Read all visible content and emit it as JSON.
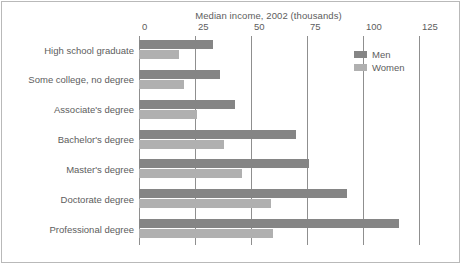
{
  "chart_data": {
    "type": "bar",
    "orientation": "horizontal",
    "title": "Median income, 2002 (thousands)",
    "xlabel": "",
    "ylabel": "",
    "xlim": [
      0,
      125
    ],
    "xticks": [
      0,
      25,
      50,
      75,
      100,
      125
    ],
    "xtick_labels": [
      "0",
      "25",
      "50",
      "75",
      "100",
      "125"
    ],
    "grid": "vertical",
    "legend_position": "top-right",
    "categories": [
      "High school graduate",
      "Some college, no degree",
      "Associate's degree",
      "Bachelor's degree",
      "Master's degree",
      "Doctorate degree",
      "Professional degree"
    ],
    "series": [
      {
        "name": "Men",
        "color": "#858585",
        "values": [
          33,
          36,
          43,
          70,
          76,
          93,
          116
        ]
      },
      {
        "name": "Women",
        "color": "#b0b0b0",
        "values": [
          18,
          20,
          26,
          38,
          46,
          59,
          60
        ]
      }
    ]
  },
  "legend": {
    "items": [
      {
        "label": "Men",
        "color": "#858585"
      },
      {
        "label": "Women",
        "color": "#b0b0b0"
      }
    ]
  },
  "colors": {
    "men": "#858585",
    "women": "#b0b0b0",
    "gridline": "#8f8f8f",
    "border": "#b9b9b9",
    "text": "#5d5d5d",
    "background": "#ffffff"
  }
}
